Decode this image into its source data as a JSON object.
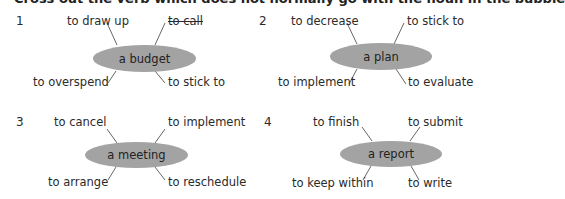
{
  "instruction": "Cross out the verb which does not normally go with the noun in the bubble",
  "exercises": [
    {
      "number": "1",
      "noun": "a budget",
      "verbs": {
        "top_left": "to draw up",
        "top_right": "to call",
        "bottom_left": "to overspend",
        "bottom_right": "to stick to"
      },
      "crossed_out": "to call"
    },
    {
      "number": "2",
      "noun": "a plan",
      "verbs": {
        "top_left": "to decrease",
        "top_right": "to stick to",
        "bottom_left": "to implement",
        "bottom_right": "to evaluate"
      },
      "crossed_out": ""
    },
    {
      "number": "3",
      "noun": "a meeting",
      "verbs": {
        "top_left": "to cancel",
        "top_right": "to implement",
        "bottom_left": "to arrange",
        "bottom_right": "to reschedule"
      },
      "crossed_out": ""
    },
    {
      "number": "4",
      "noun": "a report",
      "verbs": {
        "top_left": "to finish",
        "top_right": "to submit",
        "bottom_left": "to keep within",
        "bottom_right": "to write"
      },
      "crossed_out": ""
    }
  ],
  "colors": {
    "bubble": "#a3a3a3",
    "text": "#2a2a2a"
  }
}
